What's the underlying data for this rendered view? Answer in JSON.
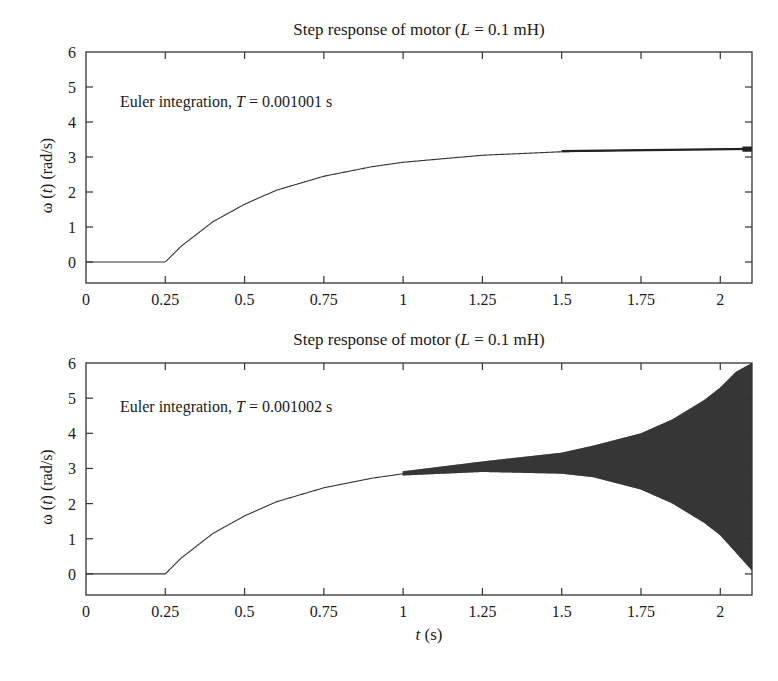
{
  "chart_data": [
    {
      "type": "line",
      "title": "Step response of motor (L = 0.1 mH)",
      "title_parts": {
        "prefix": "Step response of motor (",
        "var": "L",
        "suffix": " = 0.1 mH)"
      },
      "annotation": "Euler integration, T = 0.001001 s",
      "annotation_parts": {
        "prefix": "Euler integration, ",
        "var": "T",
        "suffix": " = 0.001001 s"
      },
      "xlabel": "",
      "ylabel": "ω(t) (rad/s)",
      "xlim": [
        0,
        2.1
      ],
      "ylim": [
        -0.6,
        6
      ],
      "xticks": [
        "0",
        "0.25",
        "0.5",
        "0.75",
        "1",
        "1.25",
        "1.5",
        "1.75",
        "2"
      ],
      "yticks": [
        "0",
        "1",
        "2",
        "3",
        "4",
        "5",
        "6"
      ],
      "grid": false,
      "series": [
        {
          "name": "omega",
          "x": [
            0,
            0.25,
            0.3,
            0.4,
            0.5,
            0.6,
            0.75,
            0.9,
            1.0,
            1.25,
            1.5,
            1.75,
            2.0,
            2.1
          ],
          "y": [
            0,
            0,
            0.45,
            1.15,
            1.65,
            2.05,
            2.45,
            2.72,
            2.85,
            3.05,
            3.15,
            3.2,
            3.22,
            3.23
          ],
          "oscillation_amplitude_note": "small stable ripple near t≈2.1 (≈±0.05)"
        }
      ]
    },
    {
      "type": "line",
      "title": "Step response of motor (L = 0.1 mH)",
      "title_parts": {
        "prefix": "Step response of motor (",
        "var": "L",
        "suffix": " = 0.1 mH)"
      },
      "annotation": "Euler integration, T = 0.001002 s",
      "annotation_parts": {
        "prefix": "Euler integration, ",
        "var": "T",
        "suffix": " = 0.001002 s"
      },
      "xlabel": "t (s)",
      "xlabel_parts": {
        "var": "t",
        "suffix": " (s)"
      },
      "ylabel": "ω(t) (rad/s)",
      "xlim": [
        0,
        2.1
      ],
      "ylim": [
        -0.6,
        6
      ],
      "xticks": [
        "0",
        "0.25",
        "0.5",
        "0.75",
        "1",
        "1.25",
        "1.5",
        "1.75",
        "2"
      ],
      "yticks": [
        "0",
        "1",
        "2",
        "3",
        "4",
        "5",
        "6"
      ],
      "grid": false,
      "series": [
        {
          "name": "omega_mean",
          "x": [
            0,
            0.25,
            0.3,
            0.4,
            0.5,
            0.6,
            0.75,
            0.9,
            1.0,
            1.25,
            1.5,
            1.75,
            2.0,
            2.1
          ],
          "y": [
            0,
            0,
            0.45,
            1.15,
            1.65,
            2.05,
            2.45,
            2.72,
            2.85,
            3.05,
            3.15,
            3.2,
            3.22,
            3.23
          ]
        },
        {
          "name": "oscillation_envelope_upper",
          "x": [
            1.0,
            1.25,
            1.5,
            1.6,
            1.75,
            1.85,
            1.95,
            2.0,
            2.05,
            2.1
          ],
          "y": [
            2.92,
            3.2,
            3.45,
            3.65,
            4.0,
            4.4,
            4.95,
            5.3,
            5.75,
            6.0
          ]
        },
        {
          "name": "oscillation_envelope_lower",
          "x": [
            1.0,
            1.25,
            1.5,
            1.6,
            1.75,
            1.85,
            1.95,
            2.0,
            2.05,
            2.1
          ],
          "y": [
            2.8,
            2.9,
            2.85,
            2.75,
            2.4,
            2.0,
            1.45,
            1.1,
            0.6,
            0.1
          ]
        }
      ]
    }
  ]
}
